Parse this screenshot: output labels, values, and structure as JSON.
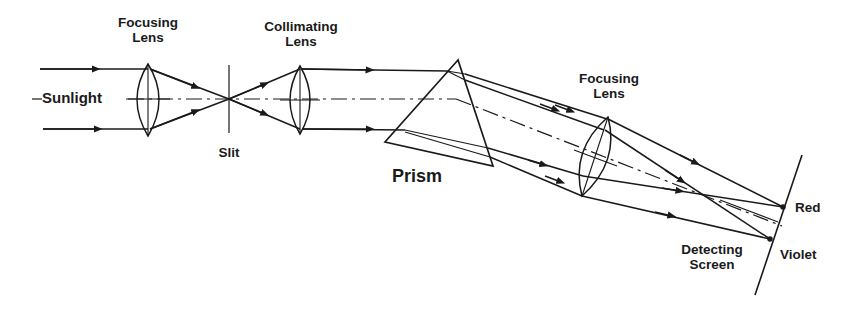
{
  "diagram": {
    "colors": {
      "ink": "#1a1a1a",
      "background": "#ffffff"
    },
    "labels": {
      "focusing_lens_1": [
        "Focusing",
        "Lens"
      ],
      "sunlight": "Sunlight",
      "slit": "Slit",
      "collimating_lens": [
        "Collimating",
        "Lens"
      ],
      "prism": "Prism",
      "focusing_lens_2": [
        "Focusing",
        "Lens"
      ],
      "red": "Red",
      "violet": "Violet",
      "detecting_screen": [
        "Detecting",
        "Screen"
      ]
    },
    "components": [
      {
        "id": "focusing-lens-1",
        "type": "convex-lens"
      },
      {
        "id": "slit",
        "type": "aperture"
      },
      {
        "id": "collimating-lens",
        "type": "convex-lens"
      },
      {
        "id": "prism",
        "type": "triangular-prism"
      },
      {
        "id": "focusing-lens-2",
        "type": "convex-lens"
      },
      {
        "id": "detecting-screen",
        "type": "screen"
      }
    ],
    "spectrum_endpoints": [
      "Red",
      "Violet"
    ]
  }
}
